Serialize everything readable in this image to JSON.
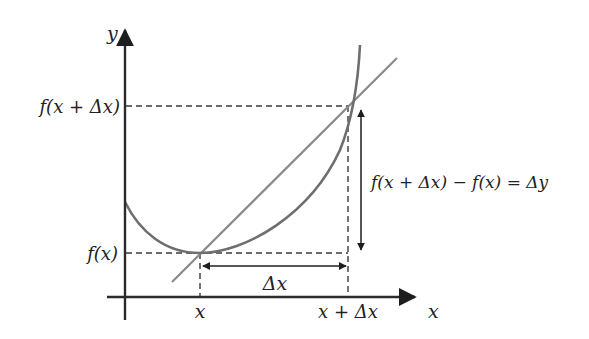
{
  "diagram": {
    "axes": {
      "x_label": "x",
      "y_label": "y"
    },
    "labels": {
      "f_x_plus_dx": "f(x + Δx)",
      "f_x": "f(x)",
      "x_point": "x",
      "x_plus_dx_point": "x + Δx",
      "delta_x": "Δx",
      "delta_y_equation": "f(x + Δx) − f(x) = Δy"
    },
    "colors": {
      "axes": "#2b2b2b",
      "curve": "#6e6e6e",
      "secant": "#8a8a8a",
      "dashed": "#3a3a3a",
      "arrows": "#1e1e1e"
    },
    "elements": {
      "curve": "y = f(x) convex curve",
      "secant_line": "line through (x, f(x)) and (x+Δx, f(x+Δx))",
      "delta_x_arrow": "horizontal double-headed arrow",
      "delta_y_arrow": "vertical double-headed arrow"
    }
  }
}
